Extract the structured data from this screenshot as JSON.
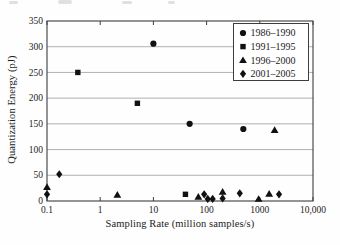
{
  "figure": {
    "background": "#fefefe",
    "ink_color": "#111111",
    "grid_color": "#8f8f8f",
    "frame_color": "#3d3d3d"
  },
  "chart_data": {
    "type": "scatter",
    "title": "",
    "xlabel": "Sampling Rate (million samples/s)",
    "ylabel": "Quantization Energy (pJ)",
    "x_scale": "log",
    "xlim": [
      0.1,
      10000
    ],
    "ylim": [
      0,
      350
    ],
    "grid": "horizontal",
    "legend_position": "top-right",
    "x_ticks": [
      {
        "value": 0.1,
        "label": "0.1"
      },
      {
        "value": 1,
        "label": "1"
      },
      {
        "value": 10,
        "label": "10"
      },
      {
        "value": 100,
        "label": "100"
      },
      {
        "value": 1000,
        "label": "1000"
      },
      {
        "value": 10000,
        "label": "10,000"
      }
    ],
    "y_ticks": [
      {
        "value": 0,
        "label": "0"
      },
      {
        "value": 50,
        "label": "50"
      },
      {
        "value": 100,
        "label": "100"
      },
      {
        "value": 150,
        "label": "150"
      },
      {
        "value": 200,
        "label": "200"
      },
      {
        "value": 250,
        "label": "250"
      },
      {
        "value": 300,
        "label": "300"
      },
      {
        "value": 350,
        "label": "350"
      }
    ],
    "series": [
      {
        "name": "1986–1990",
        "marker": "circle",
        "color": "#111111",
        "points": [
          [
            10,
            306
          ],
          [
            48,
            150
          ],
          [
            490,
            140
          ]
        ]
      },
      {
        "name": "1991–1995",
        "marker": "square",
        "color": "#111111",
        "points": [
          [
            0.38,
            250
          ],
          [
            5,
            190
          ],
          [
            40,
            13
          ]
        ]
      },
      {
        "name": "1996–2000",
        "marker": "triangle",
        "color": "#111111",
        "points": [
          [
            0.1,
            27
          ],
          [
            2.1,
            12
          ],
          [
            70,
            8
          ],
          [
            200,
            18
          ],
          [
            950,
            4
          ],
          [
            1500,
            14
          ],
          [
            1900,
            138
          ]
        ]
      },
      {
        "name": "2001–2005",
        "marker": "diamond",
        "color": "#111111",
        "points": [
          [
            0.1,
            13
          ],
          [
            0.17,
            52
          ],
          [
            90,
            13
          ],
          [
            105,
            4
          ],
          [
            130,
            4
          ],
          [
            200,
            5
          ],
          [
            420,
            15
          ],
          [
            2300,
            13
          ]
        ]
      }
    ]
  }
}
